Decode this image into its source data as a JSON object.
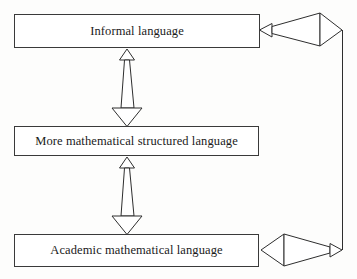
{
  "diagram": {
    "background_color": "#fdfdfc",
    "box_fill": "#ffffff",
    "stroke_color": "#2e2e2e",
    "nodes": [
      {
        "id": "informal",
        "label": "Informal language",
        "x": 14,
        "y": 14,
        "width": 246,
        "height": 34
      },
      {
        "id": "structured",
        "label": "More mathematical structured language",
        "x": 14,
        "y": 126,
        "width": 245,
        "height": 30
      },
      {
        "id": "academic",
        "label": "Academic mathematical language",
        "x": 14,
        "y": 234,
        "width": 245,
        "height": 33
      }
    ],
    "connectors": [
      {
        "id": "informal-structured",
        "type": "vertical-double-wedge",
        "from": "informal",
        "to": "structured",
        "orientation": "vertical",
        "small_head": "up",
        "large_head": "down"
      },
      {
        "id": "structured-academic",
        "type": "vertical-double-wedge",
        "from": "structured",
        "to": "academic",
        "orientation": "vertical",
        "small_head": "up",
        "large_head": "down"
      },
      {
        "id": "academic-to-informal-return",
        "type": "right-loop-wedge",
        "from": "academic",
        "to": "informal",
        "orientation": "horizontal",
        "top_head": "left",
        "bottom_head": "left"
      }
    ]
  }
}
